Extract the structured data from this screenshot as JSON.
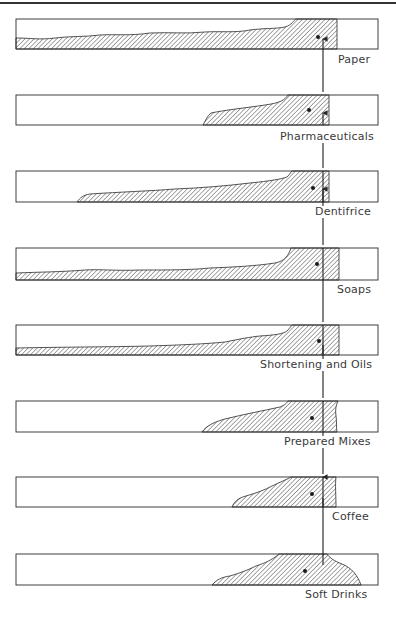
{
  "figure": {
    "title": "",
    "colors": {
      "stroke": "#2a2a2a",
      "hatch": "#3a3a3a",
      "background": "#ffffff",
      "text": "#3a3a3a"
    },
    "reference_line_x": 323,
    "panels": [
      {
        "label": "Paper",
        "box": [
          16,
          19,
          378,
          49
        ],
        "fill_end": 337,
        "dot": [
          318,
          37
        ],
        "label_pos": [
          339,
          59
        ]
      },
      {
        "label": "Pharmaceuticals",
        "box": [
          16,
          95,
          378,
          125
        ],
        "fill_end": 329,
        "dot": [
          309,
          110
        ],
        "label_pos": [
          281,
          135
        ]
      },
      {
        "label": "Dentifrice",
        "box": [
          16,
          171,
          378,
          202
        ],
        "fill_end": 329,
        "dot": [
          313,
          188
        ],
        "label_pos": [
          316,
          211
        ]
      },
      {
        "label": "Soaps",
        "box": [
          16,
          248,
          378,
          280
        ],
        "fill_end": 339,
        "dot": [
          317,
          264
        ],
        "label_pos": [
          338,
          289
        ]
      },
      {
        "label": "Shortening and Oils",
        "box": [
          16,
          325,
          378,
          355
        ],
        "fill_end": 339,
        "dot": [
          319,
          341
        ],
        "label_pos": [
          261,
          364
        ]
      },
      {
        "label": "Prepared Mixes",
        "box": [
          16,
          401,
          378,
          432
        ],
        "fill_end": 337,
        "dot": [
          312,
          418
        ],
        "label_pos": [
          285,
          440
        ]
      },
      {
        "label": "Coffee",
        "box": [
          16,
          477,
          378,
          507
        ],
        "fill_end": 336,
        "dot": [
          312,
          494
        ],
        "label_pos": [
          333,
          516
        ]
      },
      {
        "label": "Soft Drinks",
        "box": [
          16,
          554,
          378,
          585
        ],
        "fill_end": 361,
        "dot": [
          305,
          571
        ],
        "label_pos": [
          306,
          594
        ]
      }
    ]
  }
}
